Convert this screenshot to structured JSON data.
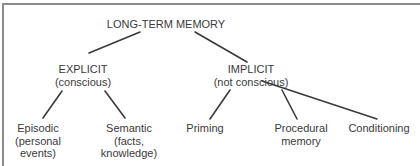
{
  "diagram": {
    "root": {
      "label": "LONG-TERM MEMORY"
    },
    "branches": [
      {
        "label": "EXPLICIT",
        "sublabel": "(conscious)",
        "children": [
          {
            "line1": "Episodic",
            "line2": "(personal",
            "line3": "events)"
          },
          {
            "line1": "Semantic",
            "line2": "(facts,",
            "line3": "knowledge)"
          }
        ]
      },
      {
        "label": "IMPLICIT",
        "sublabel": "(not conscious)",
        "children": [
          {
            "line1": "Priming"
          },
          {
            "line1": "Procedural",
            "line2": "memory"
          },
          {
            "line1": "Conditioning"
          }
        ]
      }
    ],
    "colors": {
      "line": "#3a3a3a",
      "text": "#3a3a3a",
      "border": "#8a8a8a"
    }
  }
}
